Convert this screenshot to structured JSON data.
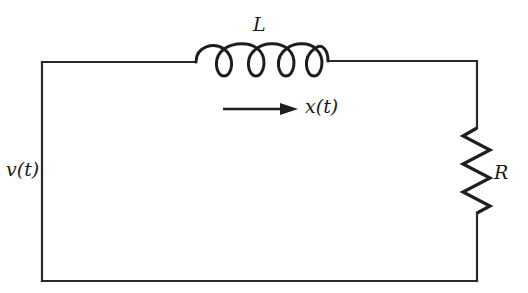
{
  "diagram": {
    "type": "RL series circuit",
    "components": [
      {
        "id": "inductor",
        "symbol": "coil",
        "label": "L"
      },
      {
        "id": "resistor",
        "symbol": "zigzag",
        "label": "R"
      },
      {
        "id": "source",
        "symbol": "voltage input",
        "label": "v(t)"
      }
    ],
    "annotations": {
      "current_arrow": {
        "label": "x(t)",
        "direction": "right"
      }
    },
    "colors": {
      "wire": "#2a2a2a",
      "background": "#ffffff",
      "text": "#1a1a1a"
    }
  }
}
